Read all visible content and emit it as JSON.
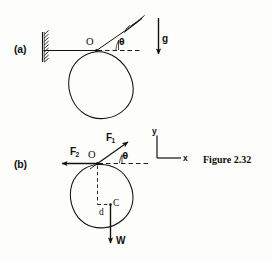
{
  "figure": {
    "caption": "Figure 2.32",
    "panels": [
      {
        "tag": "(a)",
        "pivot_label": "O",
        "angle_label": "θ",
        "gravity_label": "g",
        "support_icon": "hatched-wall-icon",
        "ceiling_icon": "hatched-support-icon",
        "description": "Rigid body suspended from pivot O with rod inclined at angle theta, gravity g acting downward"
      },
      {
        "tag": "(b)",
        "pivot_label": "O",
        "angle_label": "θ",
        "centroid_label": "C",
        "distance_label": "d",
        "weight_label": "W",
        "force_labels": [
          {
            "name": "F",
            "subscript": "1"
          },
          {
            "name": "F",
            "subscript": "2"
          }
        ],
        "axes": {
          "x": "x",
          "y": "y"
        },
        "description": "Free body diagram of the same body showing reaction forces F1 and F2 at O, weight W at centroid C a distance d below, with x-y reference axes"
      }
    ]
  },
  "colors": {
    "ink": "#111111",
    "page": "#fdfdfb"
  }
}
